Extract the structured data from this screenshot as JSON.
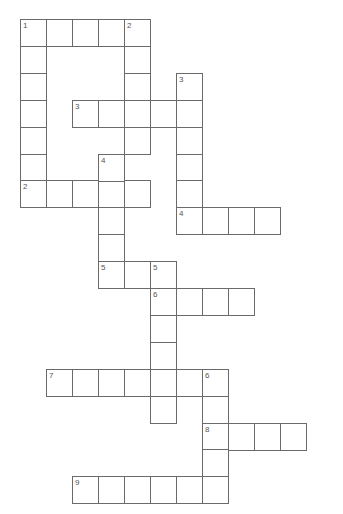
{
  "puzzle": {
    "layout": {
      "origin_x": 20,
      "origin_y": 19,
      "cell_w": 26,
      "cell_h": 26.9
    },
    "line_color": "#6a6a6a",
    "entries": [
      {
        "number": "1",
        "direction": "across",
        "col": 0,
        "row": 0,
        "length": 5
      },
      {
        "number": "1",
        "direction": "down",
        "col": 0,
        "row": 0,
        "length": 7
      },
      {
        "number": "2",
        "direction": "down",
        "col": 4,
        "row": 0,
        "length": 5
      },
      {
        "number": "2",
        "direction": "across",
        "col": 0,
        "row": 6,
        "length": 5
      },
      {
        "number": "3",
        "direction": "across",
        "col": 2,
        "row": 3,
        "length": 5
      },
      {
        "number": "3",
        "direction": "down",
        "col": 6,
        "row": 2,
        "length": 6
      },
      {
        "number": "4",
        "direction": "down",
        "col": 3,
        "row": 5,
        "length": 5
      },
      {
        "number": "4",
        "direction": "across",
        "col": 6,
        "row": 7,
        "length": 4
      },
      {
        "number": "5",
        "direction": "across",
        "col": 3,
        "row": 9,
        "length": 3
      },
      {
        "number": "5",
        "direction": "down",
        "col": 5,
        "row": 9,
        "length": 6
      },
      {
        "number": "6",
        "direction": "across",
        "col": 5,
        "row": 10,
        "length": 4
      },
      {
        "number": "7",
        "direction": "across",
        "col": 1,
        "row": 13,
        "length": 7
      },
      {
        "number": "6",
        "direction": "down",
        "col": 7,
        "row": 13,
        "length": 5
      },
      {
        "number": "8",
        "direction": "across",
        "col": 7,
        "row": 15,
        "length": 4
      },
      {
        "number": "9",
        "direction": "across",
        "col": 2,
        "row": 17,
        "length": 6
      }
    ],
    "labels": [
      {
        "text": "1",
        "col": 0,
        "row": 0
      },
      {
        "text": "2",
        "col": 4,
        "row": 0
      },
      {
        "text": "3",
        "col": 6,
        "row": 2
      },
      {
        "text": "3",
        "col": 2,
        "row": 3
      },
      {
        "text": "4",
        "col": 3,
        "row": 5
      },
      {
        "text": "2",
        "col": 0,
        "row": 6
      },
      {
        "text": "4",
        "col": 6,
        "row": 7
      },
      {
        "text": "5",
        "col": 3,
        "row": 9
      },
      {
        "text": "5",
        "col": 5,
        "row": 9
      },
      {
        "text": "6",
        "col": 5,
        "row": 10
      },
      {
        "text": "7",
        "col": 1,
        "row": 13
      },
      {
        "text": "6",
        "col": 7,
        "row": 13
      },
      {
        "text": "8",
        "col": 7,
        "row": 15
      },
      {
        "text": "9",
        "col": 2,
        "row": 17
      }
    ]
  }
}
